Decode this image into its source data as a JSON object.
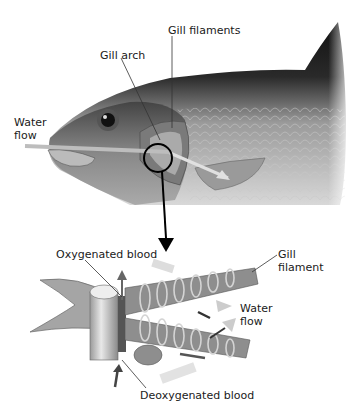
{
  "diagram": {
    "labels": {
      "gill_filaments": "Gill filaments",
      "gill_arch": "Gill arch",
      "water_flow_top": "Water\nflow",
      "oxygenated_blood": "Oxygenated blood",
      "gill_filament": "Gill\nfilament",
      "water_flow_bottom": "Water\nflow",
      "deoxygenated_blood": "Deoxygenated blood"
    },
    "colors": {
      "fish_dark": "#1a1a1a",
      "fish_mid": "#8a8a8a",
      "fish_light": "#d9d9d9",
      "arrow_light": "#bdbdbd",
      "arrow_dark": "#3a3a3a",
      "filament": "#9a9a9a"
    }
  }
}
